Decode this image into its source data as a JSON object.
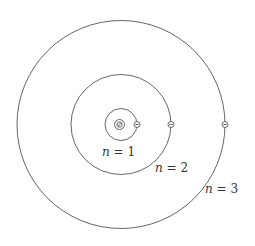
{
  "diagram": {
    "center": {
      "x": 121,
      "y": 124.5
    },
    "colors": {
      "stroke": "#555555",
      "text": "#333333",
      "background": "#ffffff",
      "nucleus_fill": "#9a9a9a"
    },
    "nucleus": {
      "r": 5
    },
    "orbits": [
      {
        "n": 1,
        "label_var": "n",
        "label_eq": " = 1",
        "radius": 16,
        "label_x": 109,
        "label_y": 156
      },
      {
        "n": 2,
        "label_var": "n",
        "label_eq": " = 2",
        "radius": 50,
        "label_x": 155,
        "label_y": 172
      },
      {
        "n": 3,
        "label_var": "n",
        "label_eq": " = 3",
        "radius": 104,
        "label_x": 205,
        "label_y": 194
      }
    ],
    "electrons": [
      {
        "orbit": 1,
        "symbol": "minus"
      },
      {
        "orbit": 2,
        "symbol": "minus"
      },
      {
        "orbit": 3,
        "symbol": "minus"
      }
    ]
  }
}
